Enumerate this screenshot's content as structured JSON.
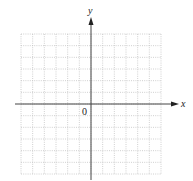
{
  "figure": {
    "type": "coordinate-grid",
    "x_axis_label": "x",
    "y_axis_label": "y",
    "origin_label": "0",
    "grid": {
      "columns": 12,
      "rows": 12,
      "style": "dotted"
    },
    "colors": {
      "axis": "#333333",
      "grid": "#bbbbbb",
      "background": "#ffffff"
    }
  }
}
